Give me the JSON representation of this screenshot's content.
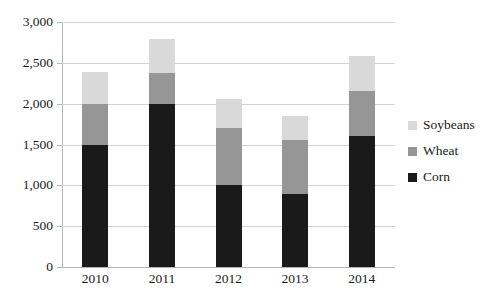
{
  "chart_data": {
    "type": "bar",
    "subtype": "stacked-bar",
    "title": "",
    "xlabel": "",
    "ylabel": "",
    "categories": [
      "2010",
      "2011",
      "2012",
      "2013",
      "2014"
    ],
    "series": [
      {
        "name": "Corn",
        "color": "#1a1a1a",
        "values": [
          1500,
          2000,
          1000,
          900,
          1600
        ]
      },
      {
        "name": "Wheat",
        "color": "#969696",
        "values": [
          500,
          370,
          700,
          650,
          550
        ]
      },
      {
        "name": "Soybeans",
        "color": "#d9d9d9",
        "values": [
          390,
          420,
          360,
          300,
          440
        ]
      }
    ],
    "totals": [
      2390,
      2790,
      2060,
      1850,
      2590
    ],
    "ylim": [
      0,
      3000
    ],
    "ytick_step": 500,
    "ytick_labels": [
      "0",
      "500",
      "1,000",
      "1,500",
      "2,000",
      "2,500",
      "3,000"
    ],
    "ytick_values": [
      0,
      500,
      1000,
      1500,
      2000,
      2500,
      3000
    ],
    "grid": true,
    "legend_position": "right",
    "legend_order": [
      "Soybeans",
      "Wheat",
      "Corn"
    ]
  },
  "legend": {
    "items": [
      {
        "label": "Soybeans",
        "color": "#d9d9d9"
      },
      {
        "label": "Wheat",
        "color": "#969696"
      },
      {
        "label": "Corn",
        "color": "#1a1a1a"
      }
    ]
  },
  "axes": {
    "y_labels": [
      "3,000",
      "2,500",
      "2,000",
      "1,500",
      "1,000",
      "500",
      "0"
    ],
    "x_labels": [
      "2010",
      "2011",
      "2012",
      "2013",
      "2014"
    ]
  },
  "colors": {
    "gridline": "#d2d2d2",
    "axis": "#b5b5b5",
    "text": "#1a1a1a",
    "background": "#ffffff"
  }
}
